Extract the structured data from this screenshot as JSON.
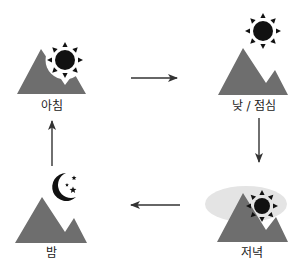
{
  "diagram": {
    "type": "cycle",
    "stages": [
      {
        "id": "morning",
        "label": "아침",
        "icon": "sun-icon"
      },
      {
        "id": "noon",
        "label": "낮 / 점심",
        "icon": "sun-icon"
      },
      {
        "id": "evening",
        "label": "저녁",
        "icon": "sun-icon",
        "haze": true
      },
      {
        "id": "night",
        "label": "밤",
        "icon": "moon-stars-icon"
      }
    ],
    "arrows": [
      {
        "from": "morning",
        "to": "noon",
        "direction": "right"
      },
      {
        "from": "noon",
        "to": "evening",
        "direction": "down"
      },
      {
        "from": "evening",
        "to": "night",
        "direction": "left"
      },
      {
        "from": "night",
        "to": "morning",
        "direction": "up"
      }
    ]
  },
  "colors": {
    "mountain": "#6e6e6e",
    "sun": "#111111",
    "moon": "#111111",
    "haze": "#e4e4e4",
    "arrow": "#333333",
    "text": "#222222"
  }
}
